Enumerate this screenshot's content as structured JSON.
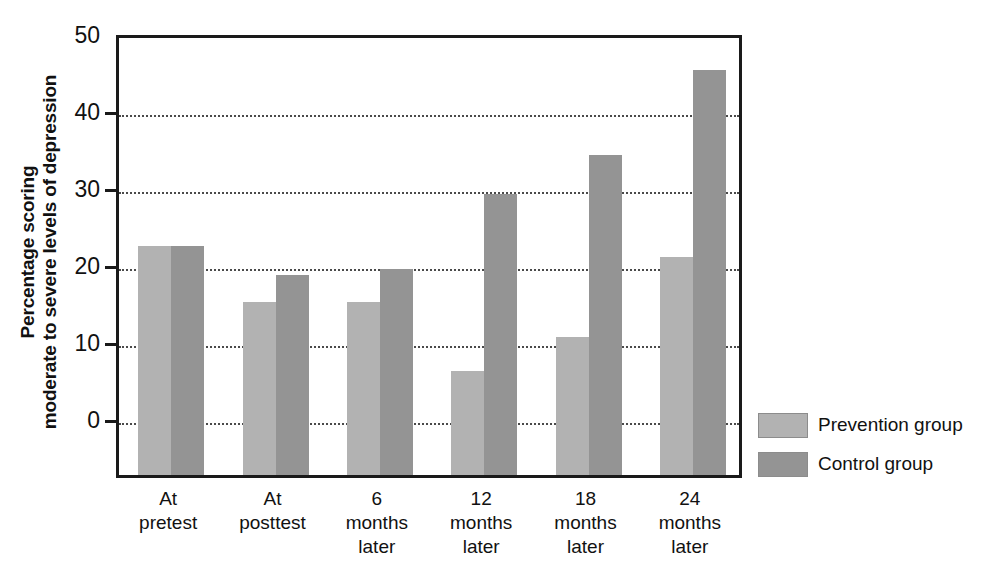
{
  "chart_data": {
    "type": "bar",
    "title": "",
    "xlabel": "",
    "ylabel": "Percentage scoring moderate to severe levels of depression",
    "ylabel_lines": [
      "Percentage scoring",
      "moderate to severe levels of depression"
    ],
    "ylim": [
      0,
      50
    ],
    "yticks": [
      0,
      10,
      20,
      30,
      40,
      50
    ],
    "ytick_labels": [
      "0",
      "10",
      "20",
      "30",
      "40",
      "50"
    ],
    "grid": true,
    "grid_axis": "y",
    "legend_position": "right",
    "categories": [
      "At pretest",
      "At posttest",
      "6 months later",
      "12 months later",
      "18 months later",
      "24 months later"
    ],
    "category_lines": [
      [
        "At",
        "pretest"
      ],
      [
        "At",
        "posttest"
      ],
      [
        "6",
        "months",
        "later"
      ],
      [
        "12",
        "months",
        "later"
      ],
      [
        "18",
        "months",
        "later"
      ],
      [
        "24",
        "months",
        "later"
      ]
    ],
    "series": [
      {
        "name": "Prevention group",
        "color": "#b2b2b2",
        "values": [
          23.0,
          15.7,
          15.7,
          6.7,
          11.2,
          21.6
        ]
      },
      {
        "name": "Control group",
        "color": "#949494",
        "values": [
          23.0,
          19.2,
          20.0,
          29.8,
          34.8,
          45.9
        ]
      }
    ]
  },
  "legend": {
    "items": [
      {
        "label": "Prevention group",
        "swatch": "prevention"
      },
      {
        "label": "Control group",
        "swatch": "control"
      }
    ]
  }
}
